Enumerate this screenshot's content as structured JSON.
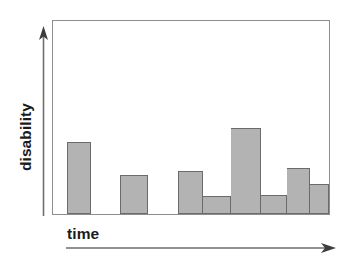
{
  "figure": {
    "background_color": "#ffffff",
    "frame_color": "#8d8d8d"
  },
  "axes": {
    "y": {
      "label": "disability",
      "arrow_icon": "up-arrow-icon",
      "direction": "up"
    },
    "x": {
      "label": "time",
      "arrow_icon": "right-arrow-icon",
      "direction": "right"
    }
  },
  "chart_data": {
    "type": "bar",
    "title": "",
    "xlabel": "time",
    "ylabel": "disability",
    "grid": false,
    "legend": null,
    "xticks": [],
    "yticks": [],
    "xlim": [
      0,
      100
    ],
    "ylim": [
      0,
      100
    ],
    "bar_fill_color": "#b3b3b3",
    "bar_edge_color": "#6b6b6b",
    "note": "Schematic step/bar profile: relapsing disability over time, no numeric tick labels shown.",
    "categories": [
      "1",
      "2",
      "3",
      "4",
      "5",
      "6",
      "7",
      "8"
    ],
    "values": [
      37.5,
      20.0,
      22.1,
      9.2,
      44.6,
      9.7,
      24.1,
      15.4
    ],
    "bars": [
      {
        "x_start": 5.0,
        "x_end": 13.7,
        "value": 37.5,
        "join_left": false
      },
      {
        "x_start": 24.1,
        "x_end": 34.5,
        "value": 20.0,
        "join_left": false
      },
      {
        "x_start": 45.3,
        "x_end": 54.3,
        "value": 22.1,
        "join_left": false
      },
      {
        "x_start": 54.3,
        "x_end": 64.4,
        "value": 9.2,
        "join_left": true
      },
      {
        "x_start": 64.4,
        "x_end": 75.5,
        "value": 44.6,
        "join_left": true
      },
      {
        "x_start": 75.5,
        "x_end": 84.9,
        "value": 9.7,
        "join_left": true
      },
      {
        "x_start": 84.9,
        "x_end": 93.2,
        "value": 24.1,
        "join_left": true
      },
      {
        "x_start": 93.2,
        "x_end": 100.0,
        "value": 15.4,
        "join_left": true
      }
    ]
  }
}
